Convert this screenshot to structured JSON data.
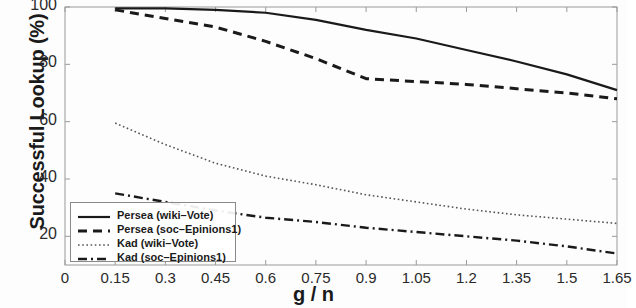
{
  "chart_data": {
    "type": "line",
    "title": "",
    "xlabel": "g / n",
    "ylabel": "Successful Lookup (%)",
    "xlim": [
      0,
      1.65
    ],
    "ylim": [
      10,
      100
    ],
    "grid": false,
    "legend_position": "lower-left",
    "xticks": [
      "0",
      "0.15",
      "0.3",
      "0.45",
      "0.6",
      "0.75",
      "0.9",
      "1.05",
      "1.2",
      "1.35",
      "1.5",
      "1.65"
    ],
    "xtick_values": [
      0,
      0.15,
      0.3,
      0.45,
      0.6,
      0.75,
      0.9,
      1.05,
      1.2,
      1.35,
      1.5,
      1.65
    ],
    "yticks": [
      "20",
      "40",
      "60",
      "80",
      "100"
    ],
    "ytick_values": [
      20,
      40,
      60,
      80,
      100
    ],
    "x": [
      0.15,
      0.3,
      0.45,
      0.6,
      0.75,
      0.9,
      1.05,
      1.2,
      1.35,
      1.5,
      1.65
    ],
    "series": [
      {
        "name": "Persea (wiki-Vote)",
        "style": "solid",
        "color": "#1a1a1a",
        "values": [
          99.5,
          99.5,
          99,
          98,
          95.5,
          92,
          89,
          85,
          81,
          76.5,
          71
        ]
      },
      {
        "name": "Persea (soc-Epinions1)",
        "style": "dashed",
        "color": "#1a1a1a",
        "values": [
          99,
          96,
          93,
          88,
          82,
          75,
          74,
          73,
          71.5,
          70,
          68
        ]
      },
      {
        "name": "Kad (wiki-Vote)",
        "style": "dotted",
        "color": "#555555",
        "values": [
          59.5,
          52,
          45.5,
          41,
          38,
          34.5,
          32,
          29.5,
          27.5,
          26,
          24.5
        ]
      },
      {
        "name": "Kad (soc-Epinions1)",
        "style": "dashdot",
        "color": "#1a1a1a",
        "values": [
          35,
          32,
          29,
          26.5,
          25,
          23,
          21.5,
          20,
          18.5,
          16.5,
          14
        ]
      }
    ]
  },
  "legend": {
    "items": [
      {
        "label": "Persea (wiki–Vote)"
      },
      {
        "label": "Persea (soc–Epinions1)"
      },
      {
        "label": "Kad (wiki–Vote)"
      },
      {
        "label": "Kad (soc–Epinions1)"
      }
    ]
  }
}
